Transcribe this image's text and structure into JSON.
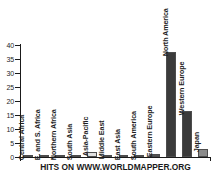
{
  "chart_data": {
    "type": "bar",
    "title": "HITS ON WWW.WORLDMAPPER.ORG",
    "xlabel": "",
    "ylabel": "",
    "ylim": [
      0,
      40
    ],
    "yticks": [
      0,
      5,
      10,
      15,
      20,
      25,
      30,
      35,
      40
    ],
    "grid": false,
    "legend": "none",
    "categories": [
      "Central Africa",
      "E. and S. Africa",
      "Northern Africa",
      "South Asia",
      "Asia-Pacific",
      "Middle East",
      "East Asia",
      "South America",
      "Eastern Europe",
      "North America",
      "Western Europe",
      "Japan"
    ],
    "values": [
      0.05,
      0.05,
      0.05,
      0.2,
      1.7,
      0.4,
      0.3,
      0.25,
      1.1,
      37.4,
      16.3,
      2.9
    ],
    "bar_colors": [
      "#4d4d4d",
      "#4d4d4d",
      "#4d4d4d",
      "#595959",
      "#e0e0e0",
      "#595959",
      "#595959",
      "#595959",
      "#545454",
      "#3b3b3b",
      "#3b3b3b",
      "#8c8c8c"
    ]
  },
  "axis": {
    "tick_labels": [
      "40",
      "35",
      "30",
      "25",
      "20",
      "15",
      "10",
      "5",
      "0"
    ]
  },
  "colors": {
    "axis": "#1a1a1a",
    "text": "#1f1f1f",
    "background": "#ffffff"
  }
}
